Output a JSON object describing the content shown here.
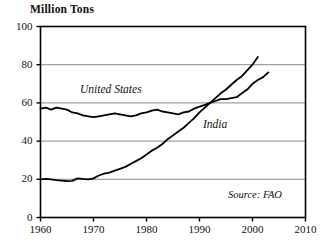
{
  "chart_data": {
    "type": "line",
    "title": "Million Tons",
    "xlabel": "",
    "ylabel": "Million Tons",
    "xlim": [
      1960,
      2010
    ],
    "ylim": [
      0,
      100
    ],
    "xticks": [
      "1960",
      "1970",
      "1980",
      "1990",
      "2000",
      "2010"
    ],
    "yticks": [
      "0",
      "20",
      "40",
      "60",
      "80",
      "100"
    ],
    "grid": "horizontal",
    "legend_position": "inline-labels",
    "annotations": [
      "Source: FAO"
    ],
    "series": [
      {
        "name": "United States",
        "label": "United States",
        "color": "#000000",
        "x": [
          1960,
          1961,
          1962,
          1963,
          1964,
          1965,
          1966,
          1967,
          1968,
          1969,
          1970,
          1971,
          1972,
          1973,
          1974,
          1975,
          1976,
          1977,
          1978,
          1979,
          1980,
          1981,
          1982,
          1983,
          1984,
          1985,
          1986,
          1987,
          1988,
          1989,
          1990,
          1991,
          1992,
          1993,
          1994,
          1995,
          1996,
          1997,
          1998,
          1999,
          2000,
          2001,
          2002,
          2003
        ],
        "values": [
          57,
          57.5,
          56.5,
          57.5,
          57,
          56.5,
          55,
          54.5,
          53.5,
          53,
          52.5,
          53,
          53.5,
          54,
          54.5,
          54,
          53.5,
          53,
          53.5,
          54.5,
          55,
          56,
          56.5,
          55.5,
          55,
          54.5,
          54,
          55,
          55.5,
          57,
          58,
          59,
          60,
          61,
          62,
          62,
          62.5,
          63,
          65,
          67,
          70,
          72,
          73.5,
          76
        ],
        "note": "US total meat production, 1960-2003"
      },
      {
        "name": "India",
        "label": "India",
        "color": "#000000",
        "x": [
          1960,
          1961,
          1962,
          1963,
          1964,
          1965,
          1966,
          1967,
          1968,
          1969,
          1970,
          1971,
          1972,
          1973,
          1974,
          1975,
          1976,
          1977,
          1978,
          1979,
          1980,
          1981,
          1982,
          1983,
          1984,
          1985,
          1986,
          1987,
          1988,
          1989,
          1990,
          1991,
          1992,
          1993,
          1994,
          1995,
          1996,
          1997,
          1998,
          1999,
          2000,
          2001
        ],
        "values": [
          20,
          20.2,
          20,
          19.6,
          19.3,
          19,
          19.2,
          20.5,
          20.2,
          20,
          20.5,
          22,
          23,
          23.5,
          24.5,
          25.5,
          26.5,
          28,
          29.5,
          31,
          33,
          35,
          36.5,
          38.5,
          41,
          43,
          45,
          47,
          49.5,
          52,
          55,
          57.5,
          60,
          62.5,
          65,
          67,
          69.5,
          72,
          74,
          77,
          80,
          84
        ],
        "note": "India total grain/meat production, 1960-2001"
      }
    ]
  },
  "labels": {
    "us_label": "United States",
    "india_label": "India",
    "source": "Source: FAO",
    "y_axis_title": "Million Tons"
  }
}
